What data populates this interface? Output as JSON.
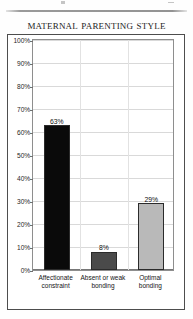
{
  "figure": {
    "title": "Maternal parenting style"
  },
  "chart_data": {
    "type": "bar",
    "title": "Maternal parenting style",
    "xlabel": "",
    "ylabel": "",
    "categories": [
      "Affectionate constraint",
      "Absent or weak bonding",
      "Optimal bonding"
    ],
    "category_lines": [
      [
        "Affectionate",
        "constraint"
      ],
      [
        "Absent or weak",
        "bonding"
      ],
      [
        "Optimal",
        "bonding"
      ]
    ],
    "values": [
      63,
      29,
      8
    ],
    "value_labels": [
      "63%",
      "8%",
      "29%"
    ],
    "bars": [
      {
        "category": "Affectionate constraint",
        "value": 63,
        "label": "63%",
        "color": "#0a0a0a"
      },
      {
        "category": "Absent or weak bonding",
        "value": 8,
        "label": "8%",
        "color": "#4a4a4a"
      },
      {
        "category": "Optimal bonding",
        "value": 29,
        "label": "29%",
        "color": "#b9b9b9"
      }
    ],
    "ylim": [
      0,
      100
    ],
    "ytick_labels": [
      "100%",
      "90%",
      "80%",
      "70%",
      "60%",
      "50%",
      "40%",
      "30%",
      "20%",
      "10%",
      "0%"
    ],
    "ytick_values": [
      100,
      90,
      80,
      70,
      60,
      50,
      40,
      30,
      20,
      10,
      0
    ],
    "grid": true,
    "legend": null
  }
}
